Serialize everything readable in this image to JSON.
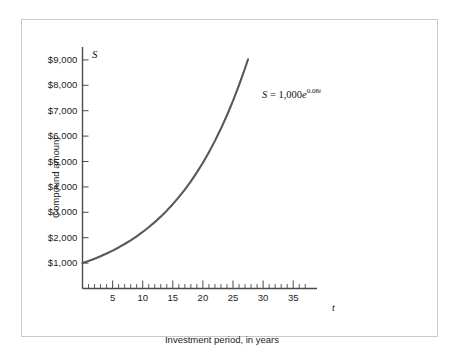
{
  "figure": {
    "axis_symbol_y": "S",
    "axis_symbol_x": "t",
    "ylabel": "Compound amount",
    "xlabel": "Investment period, in years",
    "equation": {
      "lhs": "S",
      "equals": "=",
      "coefficient": "1,000",
      "base": "e",
      "exponent_rate": "0.08",
      "exponent_var": "t",
      "full": "S = 1,000e^0.08t"
    },
    "colors": {
      "curve": "#585858",
      "axis": "#4a4a4a",
      "frame": "#c9c9c9",
      "text": "#1b1b1b",
      "background": "#ffffff"
    }
  },
  "chart_data": {
    "type": "line",
    "title": "",
    "subtitle": "",
    "xlabel": "Investment period, in years",
    "ylabel": "Compound amount",
    "xlim": [
      0,
      38
    ],
    "ylim": [
      0,
      9800
    ],
    "grid": false,
    "legend": null,
    "x_tick_labels": [
      "5",
      "10",
      "15",
      "20",
      "25",
      "30",
      "35"
    ],
    "x_tick_values": [
      5,
      10,
      15,
      20,
      25,
      30,
      35
    ],
    "x_minor_tick_step": 1,
    "y_tick_labels": [
      "$1,000",
      "$2,000",
      "$3,000",
      "$4,000",
      "$5,000",
      "$6,000",
      "$7,000",
      "$8,000",
      "$9,000"
    ],
    "y_tick_values": [
      1000,
      2000,
      3000,
      4000,
      5000,
      6000,
      7000,
      8000,
      9000
    ],
    "annotations": [
      {
        "text": "S = 1,000e^0.08t",
        "x": 26,
        "y": 8200
      }
    ],
    "series": [
      {
        "name": "S = 1,000e^(0.08t)",
        "formula": "S = 1000 * exp(0.08 * t)",
        "color": "#585858",
        "x": [
          0,
          1,
          2,
          3,
          4,
          5,
          6,
          7,
          8,
          9,
          10,
          11,
          12,
          13,
          14,
          15,
          16,
          17,
          18,
          19,
          20,
          21,
          22,
          23,
          24,
          25,
          26,
          27,
          27.5
        ],
        "values": [
          1000,
          1083,
          1174,
          1271,
          1377,
          1492,
          1616,
          1751,
          1896,
          2054,
          2226,
          2411,
          2612,
          2829,
          3065,
          3320,
          3597,
          3896,
          4221,
          4572,
          4953,
          5366,
          5812,
          6297,
          6821,
          7389,
          8004,
          8671,
          9025
        ]
      }
    ]
  }
}
